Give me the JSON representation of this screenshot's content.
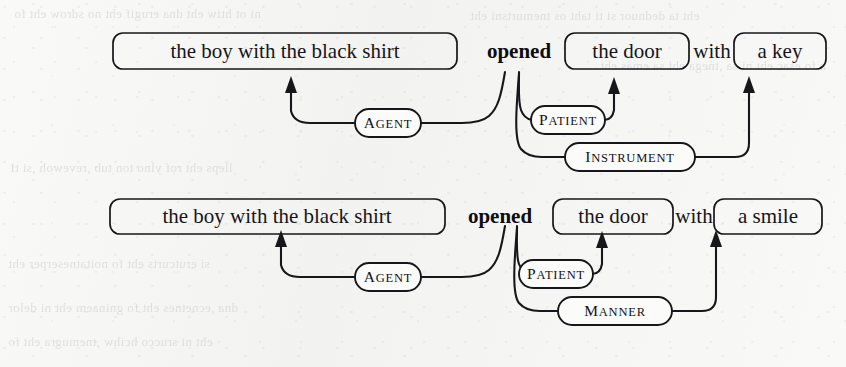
{
  "figure": {
    "kind": "semantic-role-labeling-diagram",
    "background_color": "#f3f3f1",
    "ink_color": "#17171b",
    "bleed_through_color": "#c9c9cc"
  },
  "background_bleed_text": [
    "ni ot htiw eht dna erugif eht no sdrow eht fo",
    "eht ta dednuor si ti taht os tnemurtsni eht",
    "a fo esac eht ni sa ,tnega eht sa emas eht",
    "lleps eht rof ylno ton tub ,revewoh ,si tI",
    "si erutcurts eht fo noitatneserper eht",
    "dna ,ecnetnes eht fo gninaem eht ni delor",
    "eht ni srucco hcihw ,tnemugra eht fo"
  ],
  "rows": [
    {
      "id": "row-1",
      "tokens": [
        {
          "id": "r1-subject",
          "text": "the  boy  with   the  black  shirt",
          "boxed": true,
          "bold": false
        },
        {
          "id": "r1-verb",
          "text": "opened",
          "boxed": false,
          "bold": true
        },
        {
          "id": "r1-object",
          "text": "the  door",
          "boxed": true,
          "bold": false
        },
        {
          "id": "r1-prep",
          "text": "with",
          "boxed": false,
          "bold": false
        },
        {
          "id": "r1-oblique",
          "text": "a  key",
          "boxed": true,
          "bold": false
        }
      ],
      "roles": [
        {
          "id": "r1-agent",
          "label": "Agent",
          "from": "r1-verb",
          "to": "r1-subject"
        },
        {
          "id": "r1-patient",
          "label": "Patient",
          "from": "r1-verb",
          "to": "r1-object"
        },
        {
          "id": "r1-instrument",
          "label": "Instrument",
          "from": "r1-verb",
          "to": "r1-oblique"
        }
      ]
    },
    {
      "id": "row-2",
      "tokens": [
        {
          "id": "r2-subject",
          "text": "the   boy  with  the  black  shirt",
          "boxed": true,
          "bold": false
        },
        {
          "id": "r2-verb",
          "text": "opened",
          "boxed": false,
          "bold": true
        },
        {
          "id": "r2-object",
          "text": "the  door",
          "boxed": true,
          "bold": false
        },
        {
          "id": "r2-prep",
          "text": "with",
          "boxed": false,
          "bold": false
        },
        {
          "id": "r2-oblique",
          "text": "a  smile",
          "boxed": true,
          "bold": false
        }
      ],
      "roles": [
        {
          "id": "r2-agent",
          "label": "Agent",
          "from": "r2-verb",
          "to": "r2-subject"
        },
        {
          "id": "r2-patient",
          "label": "Patient",
          "from": "r2-verb",
          "to": "r2-object"
        },
        {
          "id": "r2-manner",
          "label": "Manner",
          "from": "r2-verb",
          "to": "r2-oblique"
        }
      ]
    }
  ]
}
